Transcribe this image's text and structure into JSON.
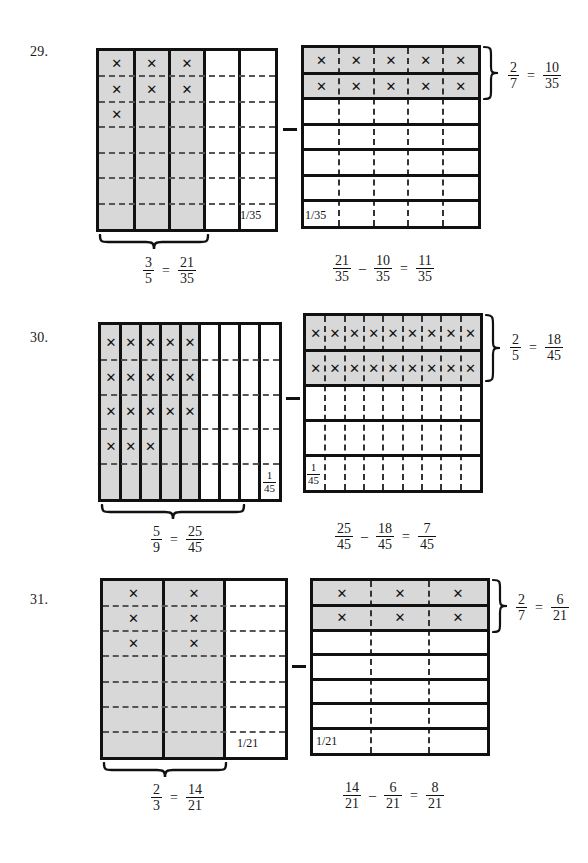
{
  "page": {
    "width": 588,
    "height": 863,
    "background": "#ffffff",
    "ink": "#111111",
    "shade": "#d8d8d8"
  },
  "problems": [
    {
      "number": "29.",
      "left_grid": {
        "cols": 5,
        "rows": 7,
        "shaded": "columns",
        "shaded_count": 3,
        "x_marks": 7,
        "unit_label": "1/35",
        "unit_label_style": "inline",
        "brace_label": {
          "left": "3/5",
          "left_num": "3",
          "left_den": "5",
          "right_num": "21",
          "right_den": "35",
          "eq": "="
        }
      },
      "right_grid": {
        "cols": 5,
        "rows": 7,
        "shaded": "rows",
        "shaded_count": 2,
        "x_marks": 10,
        "unit_label": "1/35",
        "unit_label_style": "inline",
        "brace_label": {
          "left_num": "2",
          "left_den": "7",
          "right_num": "10",
          "right_den": "35",
          "eq": "="
        }
      },
      "equation": {
        "a_num": "21",
        "a_den": "35",
        "minus": "–",
        "b_num": "10",
        "b_den": "35",
        "eq": "=",
        "c_num": "11",
        "c_den": "35"
      }
    },
    {
      "number": "30.",
      "left_grid": {
        "cols": 9,
        "rows": 5,
        "shaded": "columns",
        "shaded_count": 5,
        "x_marks": 18,
        "unit_label": "1/45",
        "unit_label_style": "stacked",
        "unit_num": "1",
        "unit_den": "45",
        "brace_label": {
          "left_num": "5",
          "left_den": "9",
          "right_num": "25",
          "right_den": "45",
          "eq": "="
        }
      },
      "right_grid": {
        "cols": 9,
        "rows": 5,
        "shaded": "rows",
        "shaded_count": 2,
        "x_marks": 18,
        "unit_label": "1/45",
        "unit_label_style": "stacked",
        "unit_num": "1",
        "unit_den": "45",
        "brace_label": {
          "left_num": "2",
          "left_den": "5",
          "right_num": "18",
          "right_den": "45",
          "eq": "="
        }
      },
      "equation": {
        "a_num": "25",
        "a_den": "45",
        "minus": "–",
        "b_num": "18",
        "b_den": "45",
        "eq": "=",
        "c_num": "7",
        "c_den": "45"
      }
    },
    {
      "number": "31.",
      "left_grid": {
        "cols": 3,
        "rows": 7,
        "shaded": "columns",
        "shaded_count": 2,
        "x_marks": 6,
        "unit_label": "1/21",
        "unit_label_style": "inline",
        "brace_label": {
          "left_num": "2",
          "left_den": "3",
          "right_num": "14",
          "right_den": "21",
          "eq": "="
        }
      },
      "right_grid": {
        "cols": 3,
        "rows": 7,
        "shaded": "rows",
        "shaded_count": 2,
        "x_marks": 6,
        "unit_label": "1/21",
        "unit_label_style": "inline",
        "brace_label": {
          "left_num": "2",
          "left_den": "7",
          "right_num": "6",
          "right_den": "21",
          "eq": "="
        }
      },
      "equation": {
        "a_num": "14",
        "a_den": "21",
        "minus": "–",
        "b_num": "6",
        "b_den": "21",
        "eq": "=",
        "c_num": "8",
        "c_den": "21"
      }
    }
  ],
  "glyphs": {
    "x_mark": "✕",
    "minus_operator": "–"
  }
}
